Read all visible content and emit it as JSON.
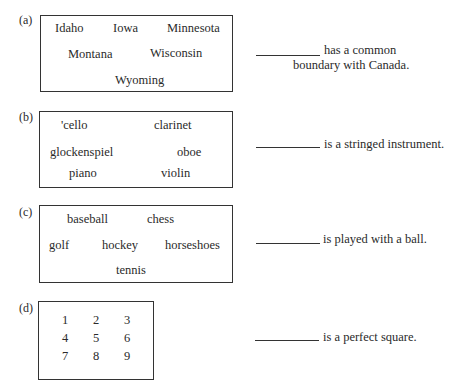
{
  "items": [
    {
      "label": "(a)",
      "words": [
        "Idaho",
        "Iowa",
        "Minnesota",
        "Montana",
        "Wisconsin",
        "Wyoming"
      ],
      "statement_line1": "has a common",
      "statement_line2": "boundary with Canada."
    },
    {
      "label": "(b)",
      "words": [
        "'cello",
        "clarinet",
        "glockenspiel",
        "oboe",
        "piano",
        "violin"
      ],
      "statement": "is a stringed instrument."
    },
    {
      "label": "(c)",
      "words": [
        "baseball",
        "chess",
        "golf",
        "hockey",
        "horseshoes",
        "tennis"
      ],
      "statement": "is played with a ball."
    },
    {
      "label": "(d)",
      "words": [
        "1",
        "2",
        "3",
        "4",
        "5",
        "6",
        "7",
        "8",
        "9"
      ],
      "statement": "is a perfect square."
    }
  ]
}
